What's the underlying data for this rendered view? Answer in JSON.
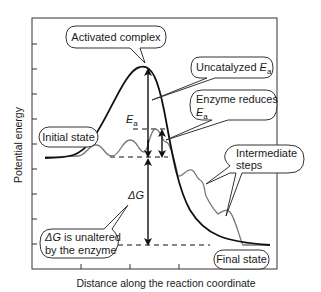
{
  "diagram": {
    "axes": {
      "x_label": "Distance along the reaction coordinate",
      "y_label": "Potential energy"
    },
    "callouts": {
      "activated_complex": "Activated complex",
      "uncatalyzed_ea_prefix": "Uncatalyzed ",
      "uncatalyzed_ea_symbol": "E",
      "uncatalyzed_ea_sub": "a",
      "enzyme_reduces_line1": "Enzyme reduces",
      "enzyme_reduces_symbol": "E",
      "enzyme_reduces_sub": "a",
      "initial_state": "Initial state",
      "intermediate_line1": "Intermediate",
      "intermediate_line2": "steps",
      "delta_g_line1_symbol": "ΔG",
      "delta_g_line1_rest": " is unaltered",
      "delta_g_line2": "by the enzyme",
      "final_state": "Final state"
    },
    "annotations": {
      "ea_symbol": "E",
      "ea_sub": "a",
      "delta_g": "ΔG"
    },
    "colors": {
      "uncatalyzed_curve": "#111111",
      "catalyzed_curve": "#777777",
      "frame": "#333333"
    }
  }
}
